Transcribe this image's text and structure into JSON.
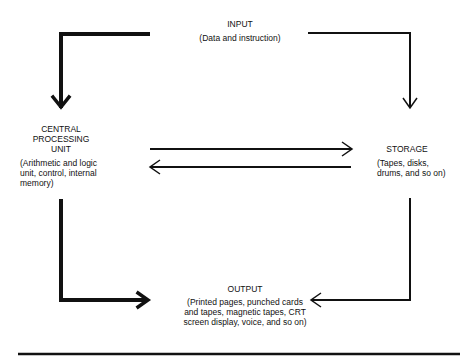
{
  "diagram": {
    "type": "computer system block diagram",
    "nodes": {
      "input": {
        "title": "INPUT",
        "description": "(Data and instruction)"
      },
      "cpu": {
        "title_line1": "CENTRAL",
        "title_line2": "PROCESSING",
        "title_line3": "UNIT",
        "description_line1": "(Arithmetic and logic",
        "description_line2": "unit, control, internal",
        "description_line3": "memory)"
      },
      "storage": {
        "title": "STORAGE",
        "description_line1": "(Tapes, disks,",
        "description_line2": "drums, and so on)"
      },
      "output": {
        "title": "OUTPUT",
        "description_line1": "(Printed pages, punched cards",
        "description_line2": "and tapes, magnetic tapes, CRT",
        "description_line3": "screen display, voice, and so on)"
      }
    },
    "edges": [
      {
        "from": "input",
        "to": "cpu",
        "style": "thick"
      },
      {
        "from": "input",
        "to": "storage",
        "style": "thin"
      },
      {
        "from": "cpu",
        "to": "storage",
        "style": "thin"
      },
      {
        "from": "storage",
        "to": "cpu",
        "style": "thin"
      },
      {
        "from": "cpu",
        "to": "output",
        "style": "thick"
      },
      {
        "from": "storage",
        "to": "output",
        "style": "thin"
      }
    ],
    "colors": {
      "line": "#111111",
      "background": "#ffffff"
    }
  }
}
